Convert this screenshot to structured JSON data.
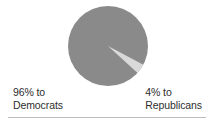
{
  "chart_data": {
    "type": "pie",
    "title": "",
    "categories": [
      "Democrats",
      "Republicans"
    ],
    "values": [
      96,
      4
    ],
    "value_unit": "%",
    "labels": [
      "96% to Democrats",
      "4% to Republicans"
    ],
    "colors": [
      "#8a8a8a",
      "#d9d9d9"
    ],
    "legend": "external-side-labels",
    "grid": false,
    "slice_start_angle_deg": 28,
    "slice_sweep_deg": 14.4,
    "center": [
      108,
      46
    ],
    "radius": 40
  },
  "figure": {
    "background_color": "#ffffff",
    "rule_color": "#bdbdbd",
    "text_color": "#2e2e2e",
    "pie": {
      "major_slice": {
        "name": "Democrats",
        "percent_label": "96%",
        "color": "#8a8a8a"
      },
      "minor_slice": {
        "name": "Republicans",
        "percent_label": "4%",
        "color": "#d9d9d9"
      }
    },
    "labels": {
      "left": {
        "line1": "96% to",
        "line2": "Democrats"
      },
      "right": {
        "line1": "4% to",
        "line2": "Republicans"
      }
    }
  }
}
